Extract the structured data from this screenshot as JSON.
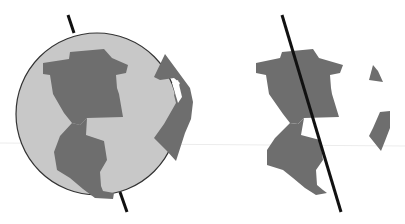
{
  "figure": {
    "colors": {
      "background": "#ffffff",
      "globe_fill": "#c8c8c8",
      "globe_outline": "#333333",
      "land": "#6e6e6e",
      "axis": "#111111",
      "faint_line": "#e6e6e6"
    },
    "panels": [
      {
        "id": "left",
        "label": "globe-with-sphere"
      },
      {
        "id": "right",
        "label": "continents-and-axis-only"
      }
    ]
  }
}
